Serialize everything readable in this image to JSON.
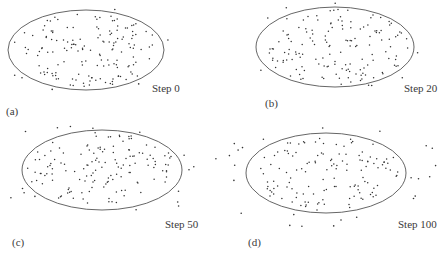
{
  "figure": {
    "panels": [
      {
        "id": "a",
        "panel_label": "(a)",
        "step_label": "Step 0",
        "panel_label_pos": [
          6,
          105
        ],
        "step_label_pos": [
          152,
          82
        ],
        "ellipse": {
          "cx": 86,
          "cy": 50,
          "rx": 78,
          "ry": 40
        }
      },
      {
        "id": "b",
        "panel_label": "(b)",
        "step_label": "Step 20",
        "panel_label_pos": [
          265,
          97
        ],
        "step_label_pos": [
          404,
          82
        ],
        "ellipse": {
          "cx": 335,
          "cy": 47,
          "rx": 79,
          "ry": 40
        }
      },
      {
        "id": "c",
        "panel_label": "(c)",
        "step_label": "Step 50",
        "panel_label_pos": [
          12,
          236
        ],
        "step_label_pos": [
          165,
          218
        ],
        "ellipse": {
          "cx": 102,
          "cy": 170,
          "rx": 80,
          "ry": 40
        }
      },
      {
        "id": "d",
        "panel_label": "(d)",
        "step_label": "Step 100",
        "panel_label_pos": [
          248,
          236
        ],
        "step_label_pos": [
          398,
          218
        ],
        "ellipse": {
          "cx": 326,
          "cy": 173,
          "rx": 80,
          "ry": 40
        }
      }
    ],
    "colors": {
      "ellipse_stroke": "#555555",
      "point": "#333333",
      "background": "#ffffff"
    }
  },
  "chart_data": [
    {
      "type": "scatter",
      "title": "Step 0",
      "panel": "(a)",
      "description": "Particles uniformly distributed inside elliptical boundary; very few outside",
      "boundary": "ellipse",
      "approx_points_inside": 150,
      "approx_points_outside": 6
    },
    {
      "type": "scatter",
      "title": "Step 20",
      "panel": "(b)",
      "description": "Particles mostly inside ellipse; a few escaping outside boundary",
      "boundary": "ellipse",
      "approx_points_inside": 145,
      "approx_points_outside": 8
    },
    {
      "type": "scatter",
      "title": "Step 50",
      "panel": "(c)",
      "description": "More particles spread outside the ellipse boundary",
      "boundary": "ellipse",
      "approx_points_inside": 140,
      "approx_points_outside": 16
    },
    {
      "type": "scatter",
      "title": "Step 100",
      "panel": "(d)",
      "description": "Particles increasingly scattered outside the ellipse",
      "boundary": "ellipse",
      "approx_points_inside": 130,
      "approx_points_outside": 25
    }
  ]
}
